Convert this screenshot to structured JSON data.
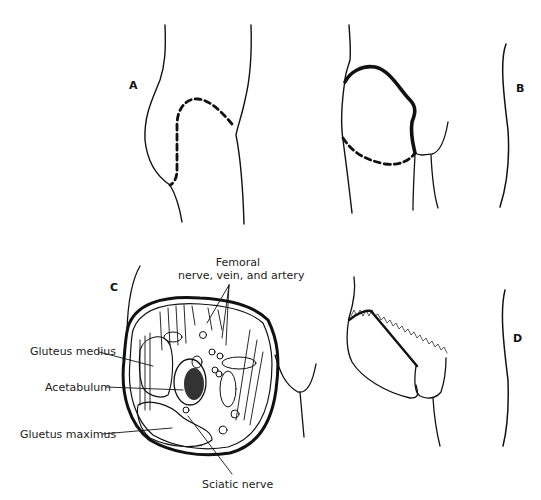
{
  "figure": {
    "panels": [
      {
        "id": "A",
        "label": "A"
      },
      {
        "id": "B",
        "label": "B"
      },
      {
        "id": "C",
        "label": "C"
      },
      {
        "id": "D",
        "label": "D"
      }
    ],
    "annotations": {
      "femoral_line1": "Femoral",
      "femoral_line2": "nerve, vein, and artery",
      "gluteus_medius": "Gluteus medius",
      "acetabulum": "Acetabulum",
      "gluteus_maximus": "Gluetus maximus",
      "sciatic_nerve": "Sciatic nerve"
    },
    "colors": {
      "ink": "#111111",
      "background": "#ffffff"
    }
  }
}
